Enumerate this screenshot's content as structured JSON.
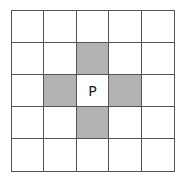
{
  "diagram": {
    "type": "grid-neighborhood",
    "rows": 5,
    "cols": 5,
    "center_label": "P",
    "shade_color": "#b3b3b3",
    "line_color": "#555555",
    "cells": [
      [
        "",
        "",
        "",
        "",
        ""
      ],
      [
        "",
        "",
        "",
        "",
        ""
      ],
      [
        "",
        "",
        "P",
        "",
        ""
      ],
      [
        "",
        "",
        "",
        "",
        ""
      ],
      [
        "",
        "",
        "",
        "",
        ""
      ]
    ],
    "shaded": [
      [
        1,
        2
      ],
      [
        2,
        1
      ],
      [
        2,
        3
      ],
      [
        3,
        2
      ]
    ]
  }
}
